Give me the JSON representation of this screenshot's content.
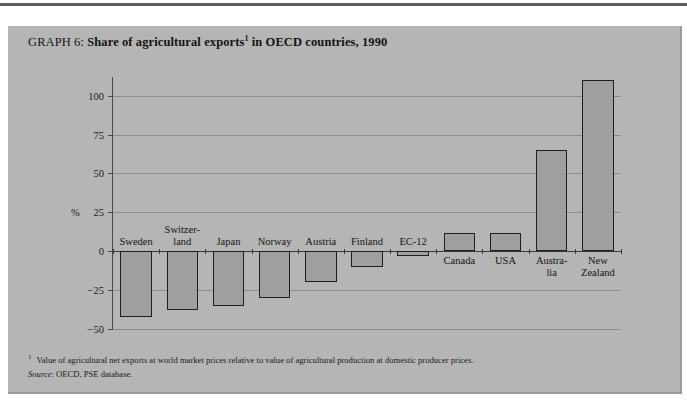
{
  "document": {
    "title_prefix": "GRAPH 6: ",
    "title_main": "Share of agricultural exports",
    "title_footnote_marker": "1",
    "title_suffix": " in OECD countries, 1990"
  },
  "footnotes": {
    "marker_1": "1",
    "text_1": "Value of agricultural net exports at world market prices relative to value of agricultural production at domestic producer prices.",
    "source_key": "Source",
    "source_text": ": OECD, PSE database."
  },
  "axis": {
    "unit_label": "%",
    "y_ticks": [
      "100",
      "75",
      "50",
      "25",
      "0",
      "−25",
      "−50"
    ]
  },
  "colors": {
    "panel_background": "#b5b5b5",
    "bar_fill": "#9f9f9f",
    "bar_outline": "#1f1f1f",
    "gridline": "#8d8d8d",
    "zero_line": "#3a3a3a",
    "text": "#141414"
  },
  "chart_data": {
    "type": "bar",
    "xlabel": "",
    "ylabel": "%",
    "ylim": [
      -50,
      112
    ],
    "grid": true,
    "legend": "none",
    "yticks": [
      100,
      75,
      50,
      25,
      0,
      -25,
      -50
    ],
    "categories": [
      "Sweden",
      "Switzer-\nland",
      "Japan",
      "Norway",
      "Austria",
      "Finland",
      "EC-12",
      "Canada",
      "USA",
      "Austra-\nlia",
      "New\nZealand"
    ],
    "values": [
      -42,
      -38,
      -35,
      -30,
      -20,
      -10,
      -3,
      12,
      12,
      65,
      110
    ]
  }
}
